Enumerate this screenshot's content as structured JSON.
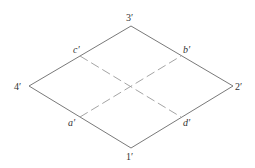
{
  "diagram": {
    "type": "isometric-square-projection",
    "vertices": [
      {
        "id": "1",
        "label": "1′",
        "x": 131,
        "y": 148
      },
      {
        "id": "2",
        "label": "2′",
        "x": 233,
        "y": 86
      },
      {
        "id": "3",
        "label": "3′",
        "x": 131,
        "y": 26
      },
      {
        "id": "4",
        "label": "4′",
        "x": 29,
        "y": 86
      }
    ],
    "midpoints": [
      {
        "id": "a",
        "label": "a′",
        "x": 80,
        "y": 117,
        "edge": "4-1"
      },
      {
        "id": "b",
        "label": "b′",
        "x": 181,
        "y": 56,
        "edge": "3-2"
      },
      {
        "id": "c",
        "label": "c′",
        "x": 80,
        "y": 56,
        "edge": "4-3"
      },
      {
        "id": "d",
        "label": "d′",
        "x": 181,
        "y": 117,
        "edge": "1-2"
      }
    ],
    "dashed_lines": [
      {
        "from": "a",
        "to": "b"
      },
      {
        "from": "c",
        "to": "d"
      }
    ],
    "labels": {
      "v1": "1′",
      "v2": "2′",
      "v3": "3′",
      "v4": "4′",
      "a": "a′",
      "b": "b′",
      "c": "c′",
      "d": "d′"
    },
    "colors": {
      "edge": "#6a6a6a",
      "dashed": "#9a9a9a",
      "text": "#333333"
    }
  }
}
